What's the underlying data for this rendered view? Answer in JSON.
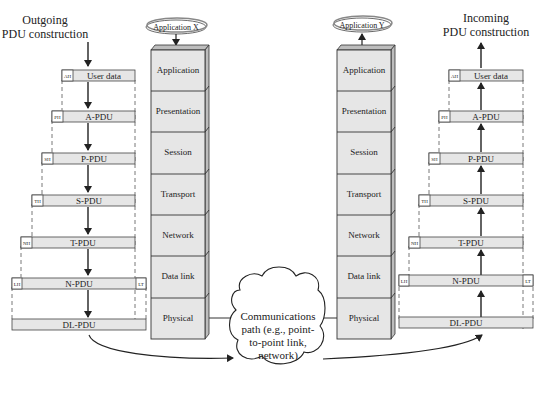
{
  "outgoing": {
    "title_line1": "Outgoing",
    "title_line2": "PDU construction",
    "pdus": [
      {
        "header": "AH",
        "label": "User data",
        "trailer": ""
      },
      {
        "header": "PH",
        "label": "A-PDU",
        "trailer": ""
      },
      {
        "header": "SH",
        "label": "P-PDU",
        "trailer": ""
      },
      {
        "header": "TH",
        "label": "S-PDU",
        "trailer": ""
      },
      {
        "header": "NH",
        "label": "T-PDU",
        "trailer": ""
      },
      {
        "header": "LH",
        "label": "N-PDU",
        "trailer": "LT"
      },
      {
        "header": "",
        "label": "DL-PDU",
        "trailer": ""
      }
    ]
  },
  "incoming": {
    "title_line1": "Incoming",
    "title_line2": "PDU construction",
    "pdus": [
      {
        "header": "AH",
        "label": "User data",
        "trailer": ""
      },
      {
        "header": "PH",
        "label": "A-PDU",
        "trailer": ""
      },
      {
        "header": "SH",
        "label": "P-PDU",
        "trailer": ""
      },
      {
        "header": "TH",
        "label": "S-PDU",
        "trailer": ""
      },
      {
        "header": "NH",
        "label": "T-PDU",
        "trailer": ""
      },
      {
        "header": "LH",
        "label": "N-PDU",
        "trailer": "LT"
      },
      {
        "header": "",
        "label": "DL-PDU",
        "trailer": ""
      }
    ]
  },
  "stack_x": {
    "application_label": "Application X",
    "layers": [
      "Application",
      "Presentation",
      "Session",
      "Transport",
      "Network",
      "Data link",
      "Physical"
    ]
  },
  "stack_y": {
    "application_label": "Application Y",
    "layers": [
      "Application",
      "Presentation",
      "Session",
      "Transport",
      "Network",
      "Data link",
      "Physical"
    ]
  },
  "cloud": {
    "line1": "Communications",
    "line2": "path (e.g., point-",
    "line3": "to-point link,",
    "line4": "network)"
  },
  "colors": {
    "box_fill": "#e6e6e6",
    "box_side": "#bdbdbd",
    "stroke": "#333333"
  }
}
